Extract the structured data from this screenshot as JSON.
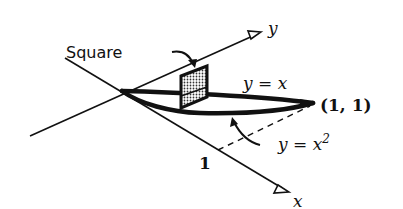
{
  "diagram": {
    "labels": {
      "square": "Square",
      "y_axis": "y",
      "x_axis": "x",
      "curve_line": "y = x",
      "curve_parabola": "y = x",
      "parabola_exponent": "2",
      "point": "(1, 1)",
      "tick_one": "1"
    },
    "colors": {
      "ink": "#111111",
      "square_fill": "#9a9a9a",
      "background": "#ffffff"
    }
  }
}
